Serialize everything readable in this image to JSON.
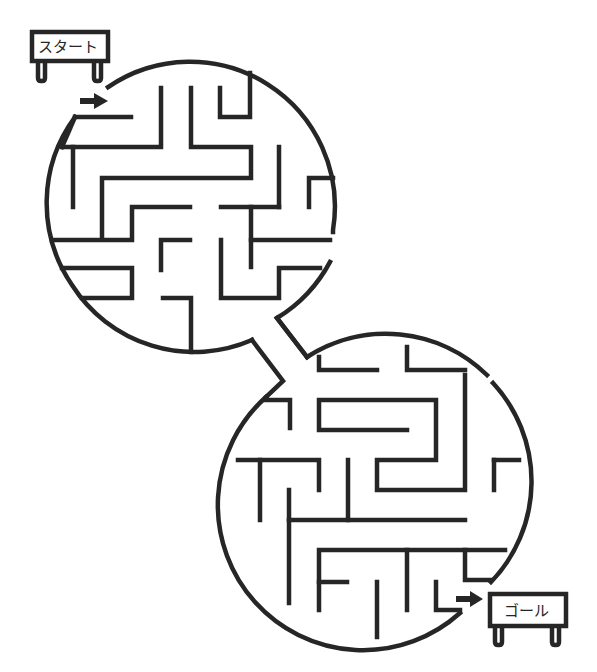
{
  "puzzle": {
    "type": "maze",
    "start_label": "スタート",
    "goal_label": "ゴール",
    "colors": {
      "line": "#262626",
      "background": "#ffffff"
    },
    "icons": {
      "start_arrow": "right-arrow",
      "goal_arrow": "right-arrow"
    }
  }
}
